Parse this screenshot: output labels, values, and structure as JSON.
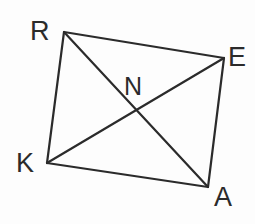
{
  "figure": {
    "background_color": "#fdfdfd",
    "stroke_color": "#2b2b2b",
    "label_color": "#2b2b2b",
    "stroke_width": 2.2,
    "width": 255,
    "height": 224
  },
  "vertices": [
    {
      "id": "R",
      "label": "R",
      "x": 64,
      "y": 32,
      "label_x": 30,
      "label_y": 18
    },
    {
      "id": "E",
      "label": "E",
      "x": 224,
      "y": 58,
      "label_x": 228,
      "label_y": 44
    },
    {
      "id": "A",
      "label": "A",
      "x": 208,
      "y": 187,
      "label_x": 214,
      "label_y": 184
    },
    {
      "id": "K",
      "label": "K",
      "x": 47,
      "y": 163,
      "label_x": 16,
      "label_y": 150
    }
  ],
  "intersection": {
    "id": "N",
    "label": "N",
    "x": 133,
    "y": 110,
    "label_x": 124,
    "label_y": 74
  },
  "edges": [
    {
      "name": "R-E",
      "from": "R",
      "to": "E"
    },
    {
      "name": "E-A",
      "from": "E",
      "to": "A"
    },
    {
      "name": "A-K",
      "from": "A",
      "to": "K"
    },
    {
      "name": "K-R",
      "from": "K",
      "to": "R"
    }
  ],
  "diagonals": [
    {
      "name": "R-A",
      "from": "R",
      "to": "A"
    },
    {
      "name": "K-E",
      "from": "K",
      "to": "E"
    }
  ]
}
